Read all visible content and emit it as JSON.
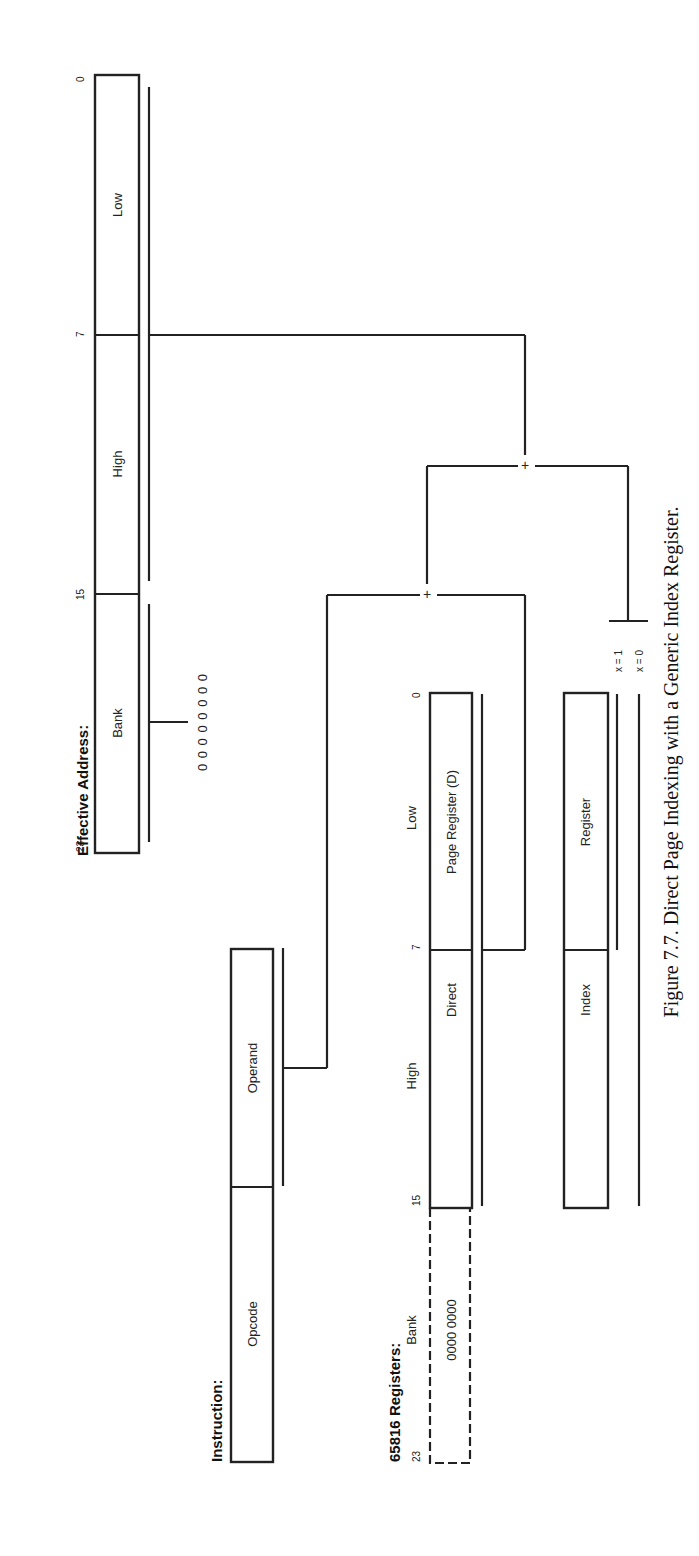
{
  "caption": "Figure 7.7. Direct Page Indexing with a Generic Index Register.",
  "effective_address": {
    "heading": "Effective Address:",
    "bit_labels": [
      "23",
      "15",
      "7",
      "0"
    ],
    "fields": [
      "Bank",
      "High",
      "Low"
    ],
    "bank_value": "0 0 0 0 0 0 0 0"
  },
  "instruction": {
    "heading": "Instruction:",
    "fields": [
      "Opcode",
      "Operand"
    ]
  },
  "registers": {
    "heading": "65816 Registers:",
    "column_labels": [
      "Bank",
      "High",
      "Low"
    ],
    "bit_labels": [
      "23",
      "15",
      "7",
      "0"
    ],
    "direct_page": {
      "bank_value": "0000 0000",
      "label_part1": "Direct",
      "label_part2": "Page Register (D)"
    },
    "index": {
      "label_part1": "Index",
      "label_part2": "Register"
    },
    "mode_labels": [
      "x = 1",
      "x = 0"
    ]
  },
  "operators": [
    "+",
    "+"
  ]
}
